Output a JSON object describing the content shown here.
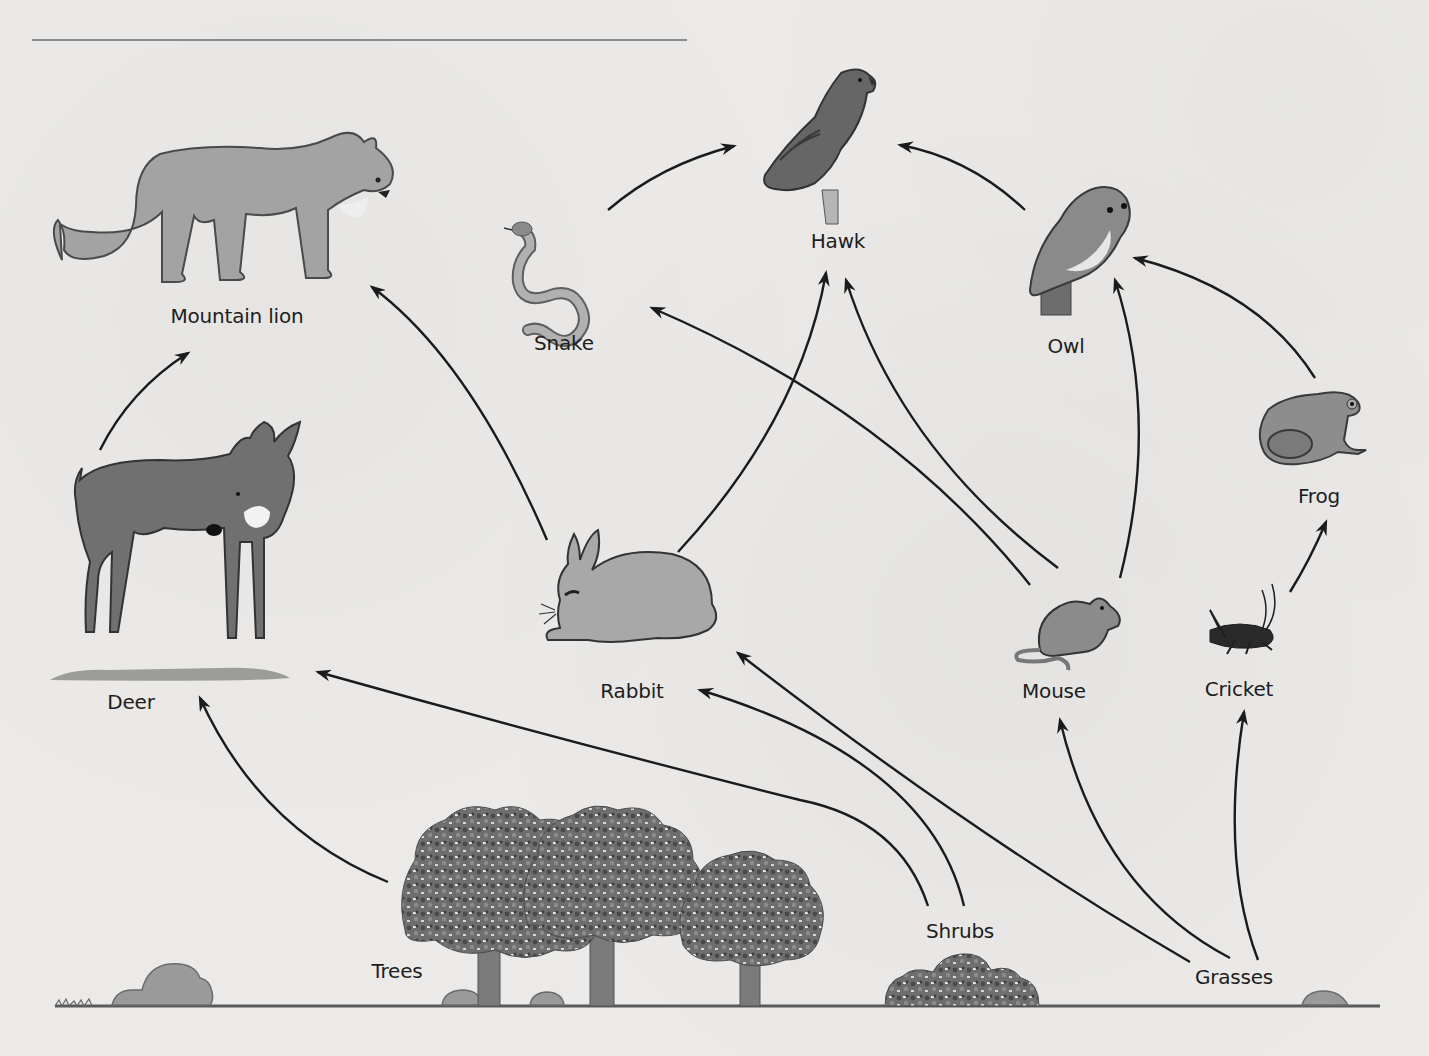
{
  "diagram": {
    "type": "food-web",
    "arrow_meaning": "points from food source to consumer (energy flow)",
    "organisms": [
      {
        "id": "mountain_lion",
        "label": "Mountain lion",
        "role": "tertiary consumer",
        "label_pos": [
          237,
          318
        ]
      },
      {
        "id": "snake",
        "label": "Snake",
        "role": "secondary consumer",
        "label_pos": [
          564,
          344
        ]
      },
      {
        "id": "hawk",
        "label": "Hawk",
        "role": "tertiary consumer",
        "label_pos": [
          838,
          242
        ]
      },
      {
        "id": "owl",
        "label": "Owl",
        "role": "tertiary consumer",
        "label_pos": [
          1066,
          347
        ]
      },
      {
        "id": "frog",
        "label": "Frog",
        "role": "secondary consumer",
        "label_pos": [
          1319,
          497
        ]
      },
      {
        "id": "deer",
        "label": "Deer",
        "role": "primary consumer",
        "label_pos": [
          131,
          703
        ]
      },
      {
        "id": "rabbit",
        "label": "Rabbit",
        "role": "primary consumer",
        "label_pos": [
          632,
          692
        ]
      },
      {
        "id": "mouse",
        "label": "Mouse",
        "role": "primary consumer",
        "label_pos": [
          1054,
          692
        ]
      },
      {
        "id": "cricket",
        "label": "Cricket",
        "role": "primary consumer",
        "label_pos": [
          1239,
          690
        ]
      },
      {
        "id": "trees",
        "label": "Trees",
        "role": "producer",
        "label_pos": [
          397,
          972
        ]
      },
      {
        "id": "shrubs",
        "label": "Shrubs",
        "role": "producer",
        "label_pos": [
          960,
          932
        ]
      },
      {
        "id": "grasses",
        "label": "Grasses",
        "role": "producer",
        "label_pos": [
          1234,
          978
        ]
      }
    ],
    "links": [
      {
        "from": "Trees",
        "to": "Deer"
      },
      {
        "from": "Shrubs",
        "to": "Deer"
      },
      {
        "from": "Shrubs",
        "to": "Rabbit"
      },
      {
        "from": "Shrubs",
        "to": "Rabbit"
      },
      {
        "from": "Grasses",
        "to": "Rabbit"
      },
      {
        "from": "Grasses",
        "to": "Mouse"
      },
      {
        "from": "Grasses",
        "to": "Cricket"
      },
      {
        "from": "Deer",
        "to": "Mountain lion"
      },
      {
        "from": "Rabbit",
        "to": "Mountain lion"
      },
      {
        "from": "Rabbit",
        "to": "Hawk"
      },
      {
        "from": "Mouse",
        "to": "Snake"
      },
      {
        "from": "Mouse",
        "to": "Hawk"
      },
      {
        "from": "Mouse",
        "to": "Owl"
      },
      {
        "from": "Snake",
        "to": "Hawk"
      },
      {
        "from": "Owl",
        "to": "Hawk"
      },
      {
        "from": "Cricket",
        "to": "Frog"
      },
      {
        "from": "Frog",
        "to": "Owl"
      }
    ]
  },
  "labels": {
    "mountain_lion": "Mountain lion",
    "snake": "Snake",
    "hawk": "Hawk",
    "owl": "Owl",
    "frog": "Frog",
    "deer": "Deer",
    "rabbit": "Rabbit",
    "mouse": "Mouse",
    "cricket": "Cricket",
    "trees": "Trees",
    "shrubs": "Shrubs",
    "grasses": "Grasses"
  },
  "colors": {
    "background": "#ebeae8",
    "ink": "#1d1d1d",
    "animal_fill": "#8f8f8f",
    "animal_dark": "#5e5e5e",
    "foliage": "#6b6b6b",
    "rule": "#8a8a8a"
  }
}
